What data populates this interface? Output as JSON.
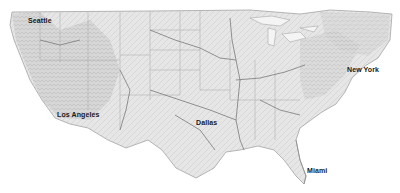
{
  "map": {
    "title": "Continental United States relief map",
    "style": "grayscale shaded relief with rivers and state boundaries",
    "colors": {
      "water": "#ffffff",
      "land": "#e9e9e9",
      "relief_dark": "#b8b8b8",
      "rivers": "#7a7a7a",
      "borders": "#9a9a9a",
      "label_text": "#1a1a1a"
    },
    "cities": [
      {
        "name": "Seattle",
        "x": 28,
        "y": 17
      },
      {
        "name": "Los Angeles",
        "x": 57,
        "y": 111
      },
      {
        "name": "Dallas",
        "x": 196,
        "y": 119
      },
      {
        "name": "New York",
        "x": 347,
        "y": 66
      },
      {
        "name": "Miami",
        "x": 307,
        "y": 167
      }
    ]
  }
}
